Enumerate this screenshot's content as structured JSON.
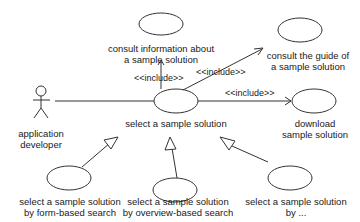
{
  "diagram": {
    "type": "uml-use-case",
    "actor": {
      "line1": "application",
      "line2": "developer"
    },
    "use_cases": {
      "consult_info": {
        "line1": "consult information about",
        "line2": "a sample solution"
      },
      "consult_guide": {
        "line1": "consult the guide of",
        "line2": "a sample solution"
      },
      "select": {
        "line1": "select a sample solution"
      },
      "download": {
        "line1": "download",
        "line2": "sample solution"
      },
      "form_search": {
        "line1": "select a sample solution",
        "line2": "by form-based search"
      },
      "overview_search": {
        "line1": "select a sample solution",
        "line2": "by overview-based search"
      },
      "other": {
        "line1": "select a sample solution",
        "line2": "by ..."
      }
    },
    "stereotypes": {
      "include_info": "<<include>>",
      "include_guide": "<<include>>",
      "include_download": "<<include>>"
    },
    "colors": {
      "line": "#333333",
      "text": "#1a1a1a",
      "background": "#ffffff"
    }
  }
}
